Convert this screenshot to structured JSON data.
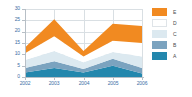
{
  "chart_data": {
    "type": "area",
    "stacked": true,
    "title": "",
    "subtitle": "",
    "xlabel": "",
    "ylabel": "",
    "categories": [
      "2002",
      "2003",
      "2004",
      "2005",
      "2006"
    ],
    "x": [
      2002,
      2003,
      2004,
      2005,
      2006
    ],
    "ylim": [
      0,
      30
    ],
    "xlim": [
      2002,
      2006
    ],
    "yticks": [
      0,
      5,
      10,
      15,
      20,
      25,
      30
    ],
    "ytick_labels": [
      "0",
      "5",
      "10",
      "15",
      "20",
      "25",
      "30"
    ],
    "xtick_labels": [
      "2002",
      "2003",
      "2004",
      "2005",
      "2006"
    ],
    "grid": true,
    "grid_axis": "both",
    "legend_position": "right",
    "legend_order_top_to_bottom": [
      "E",
      "D",
      "C",
      "B",
      "A"
    ],
    "series": [
      {
        "name": "A",
        "color": "#2387ad",
        "values": [
          2,
          4,
          2,
          5,
          1.5
        ],
        "cumulative": [
          2,
          4,
          2,
          5,
          1.5
        ]
      },
      {
        "name": "B",
        "color": "#7ba3bf",
        "values": [
          2,
          3,
          1.5,
          3,
          2.5
        ],
        "cumulative": [
          4,
          7,
          3.5,
          8,
          4
        ]
      },
      {
        "name": "C",
        "color": "#dce9f0",
        "values": [
          3.5,
          4.5,
          3,
          3,
          5
        ],
        "cumulative": [
          7.5,
          11.5,
          6.5,
          11,
          9
        ]
      },
      {
        "name": "D",
        "color": "#ffffff",
        "values": [
          3,
          6.5,
          2.5,
          5,
          6
        ],
        "cumulative": [
          10.5,
          18,
          9,
          16,
          15
        ]
      },
      {
        "name": "E",
        "color": "#f18a21",
        "values": [
          2.5,
          7.5,
          2.5,
          7.5,
          7.5
        ],
        "cumulative": [
          13,
          25.5,
          11.5,
          23.5,
          22.5
        ]
      }
    ],
    "totals": [
      13,
      25.5,
      11.5,
      23.5,
      22.5
    ]
  },
  "axes": {
    "y_tick_labels": [
      "30",
      "25",
      "20",
      "15",
      "10",
      "5",
      "0"
    ],
    "x_tick_labels": [
      "2002",
      "2003",
      "2004",
      "2005",
      "2006"
    ],
    "tick_label_color": "#3b6ea5",
    "axis_line_color": "#b7bfc6",
    "gridline_color": "#d9dfe3"
  },
  "legend": {
    "items": [
      {
        "label": "E",
        "color": "#f18a21"
      },
      {
        "label": "D",
        "color": "#ffffff"
      },
      {
        "label": "C",
        "color": "#dce9f0"
      },
      {
        "label": "B",
        "color": "#7ba3bf"
      },
      {
        "label": "A",
        "color": "#2387ad"
      }
    ]
  },
  "colors": {
    "background": "#ffffff",
    "accent": "#f18a21",
    "series_a": "#2387ad",
    "series_b": "#7ba3bf",
    "series_c": "#dce9f0",
    "series_d": "#ffffff",
    "series_e": "#f18a21",
    "tick_text": "#3b6ea5"
  }
}
